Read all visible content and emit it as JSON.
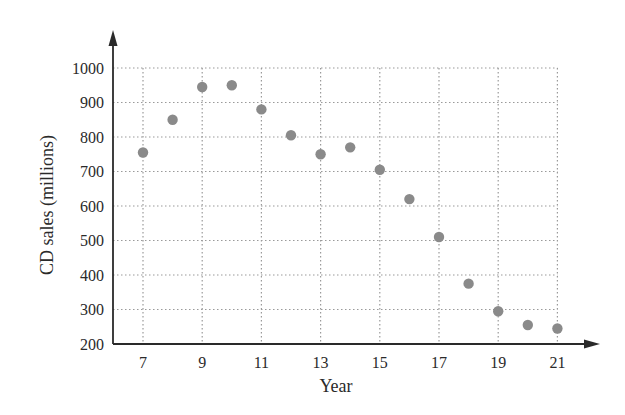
{
  "chart_data": {
    "type": "scatter",
    "title": "",
    "xlabel": "Year",
    "ylabel": "CD sales (millions)",
    "x": [
      7,
      8,
      9,
      10,
      11,
      12,
      13,
      14,
      15,
      16,
      17,
      18,
      19,
      20,
      21
    ],
    "series": [
      {
        "name": "CD sales",
        "values": [
          755,
          850,
          945,
          950,
          880,
          805,
          750,
          770,
          705,
          620,
          510,
          375,
          295,
          255,
          245
        ]
      }
    ],
    "xticks": [
      7,
      9,
      11,
      13,
      15,
      17,
      19,
      21
    ],
    "yticks": [
      200,
      300,
      400,
      500,
      600,
      700,
      800,
      900,
      1000
    ],
    "xlim": [
      6,
      21
    ],
    "ylim": [
      200,
      1000
    ],
    "grid": true,
    "grid_style": "dotted",
    "legend": null,
    "colors": {
      "marker": "#8a8a8a",
      "axis": "#2a2a2a",
      "grid": "#9a9a9a",
      "text": "#2a2a2a"
    }
  }
}
